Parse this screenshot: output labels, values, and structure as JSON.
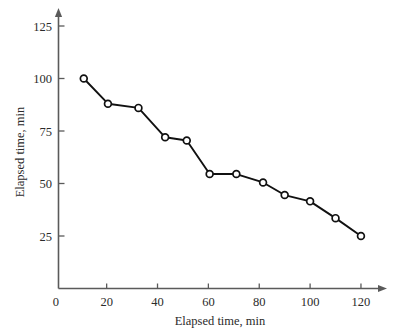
{
  "chart_data": {
    "type": "line",
    "title": "",
    "xlabel": "Elapsed time, min",
    "ylabel": "Elapsed time, min",
    "xlim": [
      0,
      130
    ],
    "ylim": [
      0,
      130
    ],
    "xticks": [
      0,
      20,
      40,
      60,
      80,
      100,
      120
    ],
    "xtick_labels": [
      "0",
      "20",
      "40",
      "60",
      "80",
      "100",
      "120"
    ],
    "yticks": [
      25,
      50,
      75,
      100,
      125
    ],
    "ytick_labels": [
      "25",
      "50",
      "75",
      "100",
      "125"
    ],
    "grid": false,
    "legend": null,
    "marker": "open-circle",
    "line_color": "#111111",
    "marker_fill": "#ffffff",
    "axis_color": "#5a5a5a",
    "background": "#ffffff",
    "series": [
      {
        "name": "Elapsed time",
        "x": [
          11,
          20.5,
          32.5,
          43,
          51.5,
          60.5,
          71,
          81.5,
          90,
          100,
          110,
          120
        ],
        "values": [
          100,
          88,
          86,
          72,
          70.5,
          54.5,
          54.5,
          50.5,
          44.5,
          41.5,
          33.5,
          25
        ]
      }
    ]
  }
}
